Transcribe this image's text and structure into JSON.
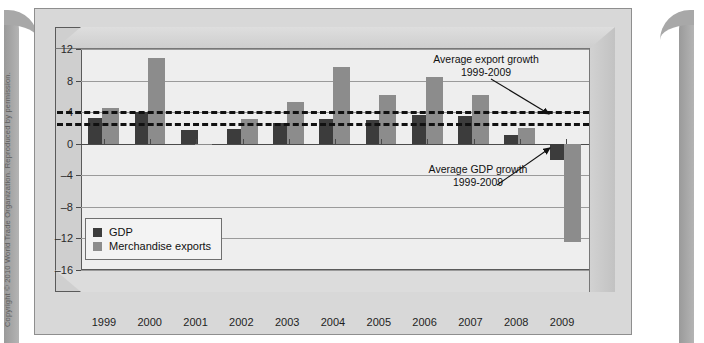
{
  "copyright": "Copyright © 2010 World Trade Organization. Reproduced by permission.",
  "legend": {
    "items": [
      {
        "label": "GDP",
        "color": "#3c3c3c"
      },
      {
        "label": "Merchandise exports",
        "color": "#8c8c8c"
      }
    ]
  },
  "annotations": [
    {
      "line1": "Average export growth",
      "line2": "1999-2009"
    },
    {
      "line1": "Average GDP growth",
      "line2": "1999-2009"
    }
  ],
  "chart_data": {
    "type": "bar",
    "title": "",
    "xlabel": "",
    "ylabel": "",
    "ylim": [
      -16,
      12
    ],
    "yticks": [
      12,
      8,
      4,
      0,
      -4,
      -8,
      -12,
      -16
    ],
    "grid": true,
    "legend_position": "inside-lower-left",
    "categories": [
      "1999",
      "2000",
      "2001",
      "2002",
      "2003",
      "2004",
      "2005",
      "2006",
      "2007",
      "2008",
      "2009"
    ],
    "series": [
      {
        "name": "GDP",
        "color": "#3c3c3c",
        "values": [
          3.2,
          4.0,
          1.7,
          1.9,
          2.6,
          3.1,
          3.0,
          3.7,
          3.5,
          1.1,
          -2.0
        ]
      },
      {
        "name": "Merchandise exports",
        "color": "#8c8c8c",
        "values": [
          4.5,
          10.8,
          -0.2,
          3.1,
          5.3,
          9.7,
          6.2,
          8.5,
          6.2,
          2.0,
          -12.5
        ]
      }
    ],
    "reference_lines": [
      {
        "name": "Average export growth 1999-2009",
        "value": 4.2,
        "style": "dashed"
      },
      {
        "name": "Average GDP growth 1999-2009",
        "value": 2.6,
        "style": "dashed"
      }
    ]
  }
}
